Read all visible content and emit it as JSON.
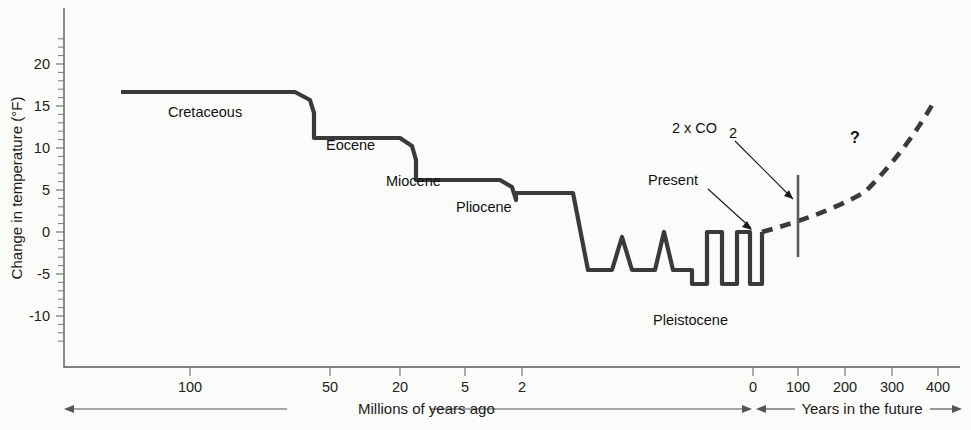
{
  "chart_data": {
    "type": "line",
    "title": "",
    "subtitle": "",
    "ylabel": "Change in temperature (°F)",
    "xlabel_past": "Millions of years ago",
    "xlabel_future": "Years in the future",
    "ylim": [
      -13.5,
      23.5
    ],
    "yticks": [
      20,
      15,
      10,
      5,
      0,
      -5,
      -10
    ],
    "ytick_labels": [
      "20",
      "15",
      "10",
      "5",
      "0",
      "-5",
      "-10"
    ],
    "y_minor_step": 1,
    "grid": false,
    "legend": "none",
    "xticks_past": [
      100,
      50,
      20,
      5,
      2
    ],
    "xtick_labels_past": [
      "100",
      "50",
      "20",
      "5",
      "2"
    ],
    "xticks_future": [
      0,
      100,
      200,
      300,
      400
    ],
    "xtick_labels_future": [
      "0",
      "100",
      "200",
      "300",
      "400"
    ],
    "x_axis_note": "Non-linear compressed geologic time scale to the left of 0, linear years to the right of 0",
    "series": [
      {
        "name": "Past temperature record",
        "style": "solid",
        "points_px": [
          [
            121,
            92
          ],
          [
            295,
            92
          ],
          [
            310,
            100
          ],
          [
            314,
            113
          ],
          [
            314,
            138
          ],
          [
            400,
            138
          ],
          [
            412,
            146
          ],
          [
            416,
            160
          ],
          [
            416,
            180
          ],
          [
            500,
            180
          ],
          [
            512,
            187
          ],
          [
            516,
            200
          ],
          [
            516,
            193
          ],
          [
            573,
            193
          ],
          [
            588,
            270
          ],
          [
            612,
            270
          ],
          [
            622,
            237
          ],
          [
            632,
            270
          ],
          [
            655,
            270
          ],
          [
            664,
            232
          ],
          [
            673,
            270
          ],
          [
            692,
            270
          ],
          [
            692,
            284
          ],
          [
            707,
            284
          ],
          [
            707,
            232
          ],
          [
            722,
            232
          ],
          [
            722,
            284
          ],
          [
            737,
            284
          ],
          [
            737,
            232
          ],
          [
            750,
            232
          ],
          [
            750,
            284
          ],
          [
            762,
            284
          ],
          [
            762,
            232
          ]
        ],
        "labeled_epochs": [
          {
            "label": "Cretaceous",
            "approx_temp_F": 15.5
          },
          {
            "label": "Eocene",
            "approx_temp_F": 11.5
          },
          {
            "label": "Miocene",
            "approx_temp_F": 7.0
          },
          {
            "label": "Pliocene",
            "approx_temp_F": 4.5
          },
          {
            "label": "Pleistocene",
            "approx_temp_F": -8.0
          }
        ]
      },
      {
        "name": "Projected future warming",
        "style": "dashed",
        "points_px": [
          [
            762,
            232
          ],
          [
            790,
            224
          ],
          [
            830,
            212
          ],
          [
            865,
            192
          ],
          [
            895,
            162
          ],
          [
            918,
            130
          ],
          [
            935,
            100
          ]
        ]
      }
    ],
    "epoch_values_F": {
      "Cretaceous": 15.5,
      "Eocene": 11.5,
      "Miocene": 7.0,
      "Pliocene": 4.5,
      "Pleistocene_interglacial": 0.0,
      "Pleistocene_glacial": -8.0,
      "Present": 0.0,
      "Projection_end_year400": 14.0
    },
    "annotations": [
      {
        "name": "2xCO2",
        "text": "2 x CO",
        "subscript": "2",
        "marker_x_years": 100
      },
      {
        "name": "Present",
        "text": "Present",
        "marker_x_years": 0
      },
      {
        "name": "Uncertainty",
        "text": "?"
      }
    ]
  },
  "axes": {
    "y_title": "Change in temperature (°F)",
    "y_ticks": [
      {
        "value": 20,
        "label": "20"
      },
      {
        "value": 15,
        "label": "15"
      },
      {
        "value": 10,
        "label": "10"
      },
      {
        "value": 5,
        "label": "5"
      },
      {
        "value": 0,
        "label": "0"
      },
      {
        "value": -5,
        "label": "-5"
      },
      {
        "value": -10,
        "label": "-10"
      }
    ],
    "x_ticks": [
      {
        "label": "100",
        "x": 190
      },
      {
        "label": "50",
        "x": 330
      },
      {
        "label": "20",
        "x": 400
      },
      {
        "label": "5",
        "x": 465
      },
      {
        "label": "2",
        "x": 522
      },
      {
        "label": "0",
        "x": 753
      },
      {
        "label": "100",
        "x": 798
      },
      {
        "label": "200",
        "x": 845
      },
      {
        "label": "300",
        "x": 892
      },
      {
        "label": "400",
        "x": 938
      }
    ],
    "x_label_past": "Millions of years ago",
    "x_label_future": "Years in the future"
  },
  "series_labels": {
    "cretaceous": "Cretaceous",
    "eocene": "Eocene",
    "miocene": "Miocene",
    "pliocene": "Pliocene",
    "pleistocene": "Pleistocene"
  },
  "annotations": {
    "co2_label": "2 x CO",
    "co2_subscript": "2",
    "present_label": "Present",
    "question_mark": "?"
  },
  "colors": {
    "line": "#3a3a3a",
    "axis": "#5a5a5a",
    "text": "#111111",
    "background": "#fbfbfa",
    "marker": "#5c5c5c"
  }
}
